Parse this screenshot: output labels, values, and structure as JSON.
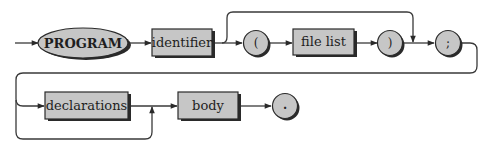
{
  "diagram": {
    "type": "syntax-diagram",
    "colors": {
      "fill": "#c6c6c6",
      "stroke": "#2a2a2a",
      "shadow": "#2a2a2a",
      "line": "#3a3a3a",
      "text": "#1e1e1e"
    },
    "nodes": [
      {
        "id": "program",
        "kind": "keyword-ellipse",
        "label": "PROGRAM"
      },
      {
        "id": "identifier",
        "kind": "nonterminal-box",
        "label": "identifier"
      },
      {
        "id": "lparen",
        "kind": "terminal-circle",
        "label": "("
      },
      {
        "id": "file_list",
        "kind": "nonterminal-box",
        "label": "file list"
      },
      {
        "id": "rparen",
        "kind": "terminal-circle",
        "label": ")"
      },
      {
        "id": "semicolon",
        "kind": "terminal-circle",
        "label": ";"
      },
      {
        "id": "declarations",
        "kind": "nonterminal-box",
        "label": "declarations"
      },
      {
        "id": "body",
        "kind": "nonterminal-box",
        "label": "body"
      },
      {
        "id": "period",
        "kind": "terminal-circle",
        "label": "."
      }
    ],
    "edges": [
      {
        "from": "start",
        "to": "program"
      },
      {
        "from": "program",
        "to": "identifier"
      },
      {
        "from": "identifier",
        "to": "lparen"
      },
      {
        "from": "identifier",
        "to": "semicolon",
        "note": "bypass optional file list"
      },
      {
        "from": "lparen",
        "to": "file_list"
      },
      {
        "from": "file_list",
        "to": "rparen"
      },
      {
        "from": "rparen",
        "to": "semicolon"
      },
      {
        "from": "semicolon",
        "to": "declarations"
      },
      {
        "from": "semicolon",
        "to": "body",
        "note": "bypass optional declarations"
      },
      {
        "from": "declarations",
        "to": "body"
      },
      {
        "from": "body",
        "to": "period"
      }
    ]
  }
}
